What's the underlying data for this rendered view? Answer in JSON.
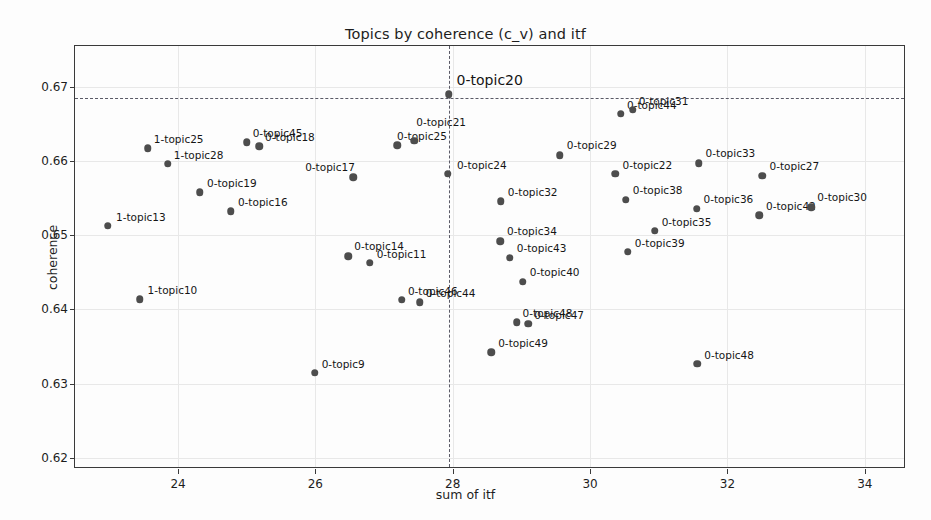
{
  "chart_data": {
    "type": "scatter",
    "title": "Topics by coherence (c_v) and itf",
    "xlabel": "sum of itf",
    "ylabel": "coherence",
    "xlim": [
      22.5,
      34.6
    ],
    "ylim": [
      0.6185,
      0.6755
    ],
    "xticks": [
      24,
      26,
      28,
      30,
      32,
      34
    ],
    "yticks": [
      0.62,
      0.63,
      0.64,
      0.65,
      0.66,
      0.67
    ],
    "ytick_labels": [
      "0.62",
      "0.63",
      "0.64",
      "0.65",
      "0.66",
      "0.67"
    ],
    "xtick_labels": [
      "24",
      "26",
      "28",
      "30",
      "32",
      "34"
    ],
    "grid": true,
    "legend": "none",
    "marker_color": "#4d4d4d",
    "reference_lines": {
      "vertical_x": 27.94,
      "horizontal_y": 0.6685,
      "style": "dashed",
      "color": "#5a5a66"
    },
    "points": [
      {
        "label": "1-topic13",
        "x": 22.98,
        "y": 0.6513,
        "lx": 8,
        "ly": -9
      },
      {
        "label": "1-topic10",
        "x": 23.44,
        "y": 0.6414,
        "lx": 8,
        "ly": -9
      },
      {
        "label": "1-topic25",
        "x": 23.56,
        "y": 0.6617,
        "lx": 6,
        "ly": -9
      },
      {
        "label": "1-topic28",
        "x": 23.85,
        "y": 0.6596,
        "lx": 6,
        "ly": -9
      },
      {
        "label": "0-topic19",
        "x": 24.32,
        "y": 0.6558,
        "lx": 7,
        "ly": -9
      },
      {
        "label": "0-topic16",
        "x": 24.77,
        "y": 0.6532,
        "lx": 7,
        "ly": -9
      },
      {
        "label": "0-topic45",
        "x": 25.0,
        "y": 0.6625,
        "lx": 6,
        "ly": -9
      },
      {
        "label": "0-topic18",
        "x": 25.18,
        "y": 0.662,
        "lx": 6,
        "ly": -9
      },
      {
        "label": "0-topic9",
        "x": 25.99,
        "y": 0.6315,
        "lx": 7,
        "ly": -9
      },
      {
        "label": "0-topic14",
        "x": 26.48,
        "y": 0.6472,
        "lx": 6,
        "ly": -10
      },
      {
        "label": "0-topic17",
        "x": 26.55,
        "y": 0.6578,
        "lx": -48,
        "ly": -10
      },
      {
        "label": "0-topic11",
        "x": 26.79,
        "y": 0.6463,
        "lx": 7,
        "ly": -9
      },
      {
        "label": "0-topic25",
        "x": 27.19,
        "y": 0.6621,
        "lx": 0,
        "ly": -9
      },
      {
        "label": "0-topic21",
        "x": 27.44,
        "y": 0.6627,
        "lx": 2,
        "ly": -19
      },
      {
        "label": "0-topic46",
        "x": 27.26,
        "y": 0.6413,
        "lx": 6,
        "ly": -9
      },
      {
        "label": "0-topic44",
        "x": 27.52,
        "y": 0.641,
        "lx": 6,
        "ly": -9
      },
      {
        "label": "0-topic24",
        "x": 27.93,
        "y": 0.6583,
        "lx": 9,
        "ly": -9
      },
      {
        "label": "0-topic20",
        "x": 27.94,
        "y": 0.669,
        "lx": 8,
        "ly": -14
      },
      {
        "label": "0-topic49",
        "x": 28.56,
        "y": 0.6342,
        "lx": 7,
        "ly": -9
      },
      {
        "label": "0-topic34",
        "x": 28.69,
        "y": 0.6492,
        "lx": 7,
        "ly": -10
      },
      {
        "label": "0-topic32",
        "x": 28.7,
        "y": 0.6546,
        "lx": 7,
        "ly": -9
      },
      {
        "label": "0-topic43",
        "x": 28.83,
        "y": 0.647,
        "lx": 7,
        "ly": -10
      },
      {
        "label": "0-topic48b",
        "x": 28.93,
        "y": 0.6383,
        "lx": 6,
        "ly": -9
      },
      {
        "label": "0-topic47",
        "x": 29.1,
        "y": 0.6381,
        "lx": 6,
        "ly": -9
      },
      {
        "label": "0-topic40",
        "x": 29.02,
        "y": 0.6437,
        "lx": 7,
        "ly": -10
      },
      {
        "label": "0-topic29",
        "x": 29.56,
        "y": 0.6608,
        "lx": 7,
        "ly": -10
      },
      {
        "label": "0-topic22",
        "x": 30.37,
        "y": 0.6583,
        "lx": 7,
        "ly": -9
      },
      {
        "label": "0-topic44b",
        "x": 30.45,
        "y": 0.6664,
        "lx": 6,
        "ly": -9
      },
      {
        "label": "0-topic31",
        "x": 30.62,
        "y": 0.6669,
        "lx": 6,
        "ly": -9
      },
      {
        "label": "0-topic38",
        "x": 30.52,
        "y": 0.6548,
        "lx": 7,
        "ly": -10
      },
      {
        "label": "0-topic39",
        "x": 30.55,
        "y": 0.6478,
        "lx": 7,
        "ly": -9
      },
      {
        "label": "0-topic35",
        "x": 30.94,
        "y": 0.6506,
        "lx": 7,
        "ly": -9
      },
      {
        "label": "0-topic33",
        "x": 31.58,
        "y": 0.6597,
        "lx": 7,
        "ly": -10
      },
      {
        "label": "0-topic48",
        "x": 31.56,
        "y": 0.6327,
        "lx": 7,
        "ly": -9
      },
      {
        "label": "0-topic36",
        "x": 31.55,
        "y": 0.6536,
        "lx": 7,
        "ly": -10
      },
      {
        "label": "0-topic42",
        "x": 32.46,
        "y": 0.6527,
        "lx": 7,
        "ly": -9
      },
      {
        "label": "0-topic27",
        "x": 32.51,
        "y": 0.658,
        "lx": 7,
        "ly": -10
      },
      {
        "label": "0-topic30",
        "x": 33.22,
        "y": 0.6538,
        "lx": 6,
        "ly": -10
      }
    ]
  }
}
